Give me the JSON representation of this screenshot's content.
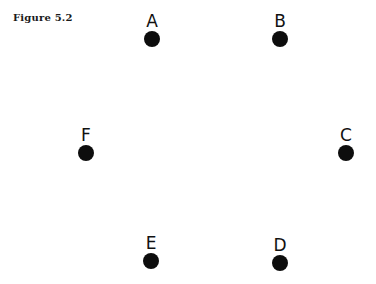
{
  "caption": "Figure 5.2",
  "nodes": [
    {
      "label": "A",
      "x": 137,
      "y": 12
    },
    {
      "label": "B",
      "x": 265,
      "y": 12
    },
    {
      "label": "C",
      "x": 331,
      "y": 126
    },
    {
      "label": "D",
      "x": 265,
      "y": 236
    },
    {
      "label": "E",
      "x": 136,
      "y": 234
    },
    {
      "label": "F",
      "x": 71,
      "y": 126
    }
  ]
}
